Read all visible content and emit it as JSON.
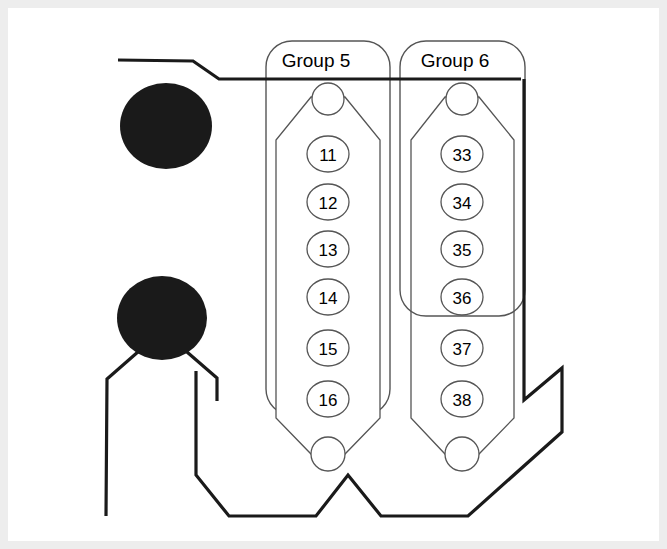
{
  "figure": {
    "background_color": "#ffffff",
    "frame_color": "#ededed",
    "line_color": "#1a1a1a",
    "thin_line_color": "#4d4d4d",
    "blob_color": "#1a1a1a"
  },
  "groups": [
    {
      "id": "group-5",
      "label": "Group 5",
      "label_x": 316,
      "label_y": 60,
      "box": {
        "x": 266,
        "y": 41,
        "width": 124,
        "height": 374,
        "radius": 26
      },
      "body": {
        "left": 276,
        "right": 380,
        "top_y": 120,
        "bottom_y": 418,
        "apex_top_y": 92,
        "apex_bottom_y": 455,
        "center_x": 328
      },
      "top_circle": {
        "cx": 328,
        "cy": 99,
        "r": 15
      },
      "bottom_circle": {
        "cx": 328,
        "cy": 454,
        "r": 16
      },
      "pins": [
        {
          "label": "11",
          "cx": 328,
          "cy": 154,
          "rx": 21,
          "ry": 18
        },
        {
          "label": "12",
          "cx": 328,
          "cy": 202,
          "rx": 21,
          "ry": 18
        },
        {
          "label": "13",
          "cx": 328,
          "cy": 249,
          "rx": 21,
          "ry": 18
        },
        {
          "label": "14",
          "cx": 328,
          "cy": 297,
          "rx": 21,
          "ry": 18
        },
        {
          "label": "15",
          "cx": 328,
          "cy": 348,
          "rx": 21,
          "ry": 18
        },
        {
          "label": "16",
          "cx": 328,
          "cy": 399,
          "rx": 21,
          "ry": 18
        }
      ]
    },
    {
      "id": "group-6",
      "label": "Group 6",
      "label_x": 455,
      "label_y": 60,
      "box": {
        "x": 400,
        "y": 41,
        "width": 125,
        "height": 275,
        "radius": 26
      },
      "body": {
        "left": 411,
        "right": 514,
        "top_y": 120,
        "bottom_y": 418,
        "apex_top_y": 92,
        "apex_bottom_y": 455,
        "center_x": 462
      },
      "top_circle": {
        "cx": 462,
        "cy": 99,
        "r": 15
      },
      "bottom_circle": {
        "cx": 462,
        "cy": 454,
        "r": 16
      },
      "pins": [
        {
          "label": "33",
          "cx": 462,
          "cy": 154,
          "rx": 21,
          "ry": 18
        },
        {
          "label": "34",
          "cx": 462,
          "cy": 202,
          "rx": 21,
          "ry": 18
        },
        {
          "label": "35",
          "cx": 462,
          "cy": 249,
          "rx": 21,
          "ry": 18
        },
        {
          "label": "36",
          "cx": 462,
          "cy": 297,
          "rx": 21,
          "ry": 18
        },
        {
          "label": "37",
          "cx": 462,
          "cy": 348,
          "rx": 21,
          "ry": 18
        },
        {
          "label": "38",
          "cx": 462,
          "cy": 399,
          "rx": 21,
          "ry": 18
        }
      ]
    }
  ],
  "blobs": [
    {
      "id": "blob-upper",
      "cx": 166,
      "cy": 126,
      "rx": 46,
      "ry": 43
    },
    {
      "id": "blob-lower",
      "cx": 162,
      "cy": 318,
      "rx": 45,
      "ry": 42
    }
  ],
  "paths": {
    "top_lead": "M 118 60 L 193 61 L 219 79 L 521 79",
    "harness_outline": "M 524 79 L 524 400 L 562 368 L 562 432 L 468 516 L 381 516 L 348 475 L 316 516 L 229 516 L 196 475 L 196 371",
    "lower_left_branch": "M 139 351 L 107 379 L 106 516",
    "lower_right_branch": "M 187 352 L 217 378 L 217 401"
  }
}
